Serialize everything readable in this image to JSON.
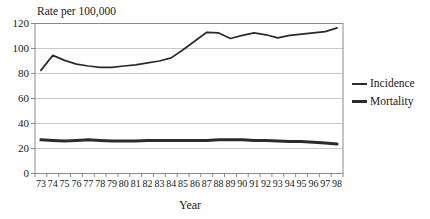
{
  "window": {
    "width": 430,
    "height": 219,
    "background": "#ffffff"
  },
  "colors": {
    "series_stroke": "#2b2b2b",
    "grid": "#c9c9c9",
    "plot_border": "#8a8a8a",
    "tick": "#8a8a8a",
    "text": "#1a1a1a",
    "background": "#ffffff"
  },
  "chart_data": {
    "type": "line",
    "title": "Rate per 100,000",
    "xlabel": "Year",
    "ylabel": "Rate per 100,000",
    "ylim": [
      0,
      120
    ],
    "y_ticks": [
      0,
      20,
      40,
      60,
      80,
      100,
      120
    ],
    "grid": "horizontal",
    "legend_position": "right-middle",
    "categories": [
      "73",
      "74",
      "75",
      "76",
      "77",
      "78",
      "79",
      "80",
      "81",
      "82",
      "83",
      "84",
      "85",
      "86",
      "87",
      "88",
      "89",
      "90",
      "91",
      "92",
      "93",
      "94",
      "95",
      "96",
      "97",
      "98"
    ],
    "series": [
      {
        "name": "Incidence",
        "line_weight": "thin",
        "values": [
          82.5,
          94.5,
          90.5,
          87.5,
          86,
          85,
          85,
          86,
          87,
          88.5,
          90,
          92.5,
          99,
          106,
          113,
          112.5,
          108,
          110.5,
          112.5,
          111,
          108.5,
          110.5,
          111.5,
          112.5,
          113.5,
          116.5
        ]
      },
      {
        "name": "Mortality",
        "line_weight": "thick",
        "values": [
          27,
          26.5,
          26,
          26.5,
          27,
          26.5,
          26,
          26,
          26,
          26.5,
          26.5,
          26.5,
          26.5,
          26.5,
          26.5,
          27,
          27,
          27,
          26.5,
          26.5,
          26,
          25.5,
          25.5,
          25,
          24.5,
          23.5
        ]
      }
    ]
  },
  "legend": {
    "items": [
      {
        "label": "Incidence",
        "swatch": "thin-line"
      },
      {
        "label": "Mortality",
        "swatch": "thick-line"
      }
    ]
  }
}
